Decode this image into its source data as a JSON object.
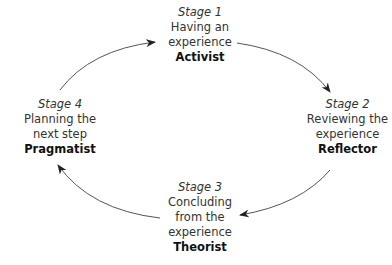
{
  "diagram": {
    "stages": [
      {
        "label": "Stage 1",
        "line1": "Having an",
        "line2": "experience",
        "role": "Activist"
      },
      {
        "label": "Stage 2",
        "line1": "Reviewing the",
        "line2": "experience",
        "role": "Reflector"
      },
      {
        "label": "Stage 3",
        "line1": "Concluding",
        "line2": "from the",
        "line3": "experience",
        "role": "Theorist"
      },
      {
        "label": "Stage 4",
        "line1": "Planning the",
        "line2": "next step",
        "role": "Pragmatist"
      }
    ],
    "arrows": [
      "Stage 4 → Stage 1",
      "Stage 1 → Stage 2",
      "Stage 2 → Stage 3",
      "Stage 3 → Stage 4"
    ],
    "colors": {
      "line": "#555555",
      "text": "#333333"
    }
  }
}
